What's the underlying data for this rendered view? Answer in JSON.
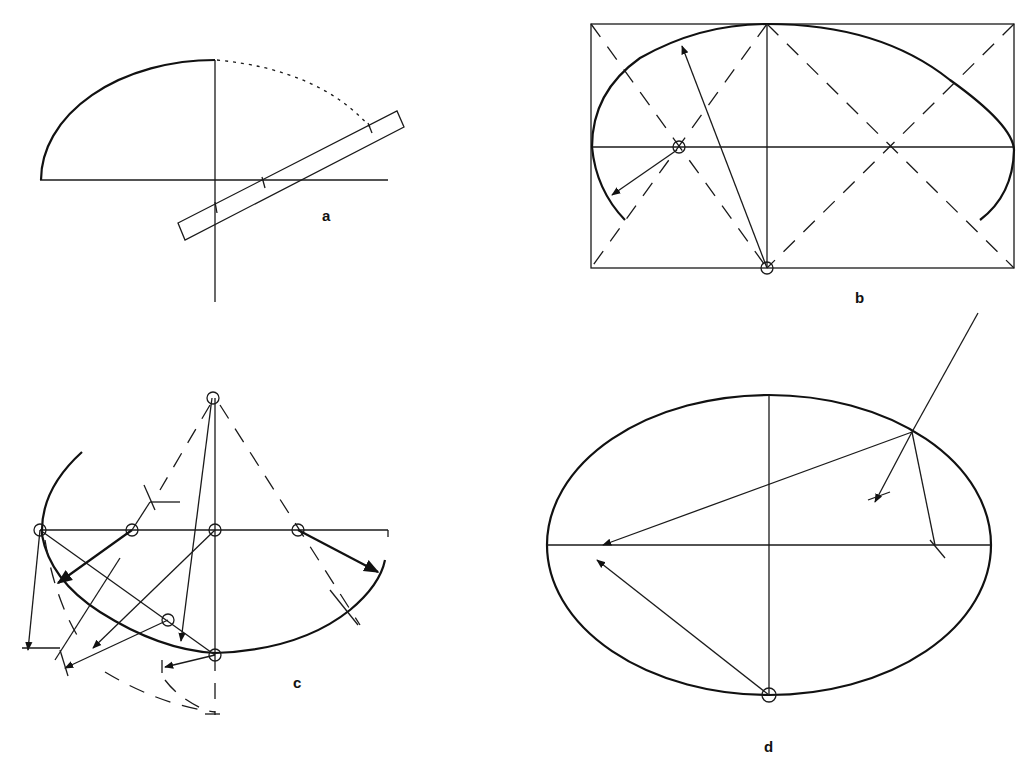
{
  "figures": {
    "a": {
      "label": "a",
      "description": "Trammel method: quarter ellipse with paper strip trammel marked at three points",
      "quarter_ellipse": {
        "cx": 215,
        "cy": 180,
        "rx": 174,
        "ry": 120
      },
      "axes": {
        "horizontal": [
          40,
          180,
          388,
          180
        ],
        "vertical": [
          215,
          60,
          215,
          302
        ]
      },
      "dotted_arc": {
        "from": [
          215,
          60
        ],
        "to": [
          370,
          127
        ]
      },
      "trammel_strip": [
        [
          178,
          223
        ],
        [
          397,
          111
        ],
        [
          404,
          127
        ],
        [
          185,
          240
        ]
      ],
      "trammel_marks": [
        [
          215,
          207
        ],
        [
          263,
          182
        ],
        [
          370,
          127
        ]
      ]
    },
    "b": {
      "label": "b",
      "description": "Four-center approximate ellipse within a rectangle",
      "rectangle": [
        591,
        24,
        1014,
        268
      ],
      "axes": {
        "horizontal": [
          591,
          147,
          1014,
          147
        ],
        "vertical": [
          767,
          24,
          767,
          268
        ]
      },
      "center_small": [
        679,
        147
      ],
      "center_large": [
        767,
        268
      ],
      "right_center": [
        857,
        147
      ]
    },
    "c": {
      "label": "c",
      "description": "Multi-center arc construction with compass swings",
      "major_axis": [
        40,
        530,
        388,
        530
      ],
      "minor_axis": [
        215,
        398,
        215,
        715
      ],
      "centers": [
        [
          40,
          530
        ],
        [
          132,
          530
        ],
        [
          215,
          530
        ],
        [
          298,
          530
        ],
        [
          168,
          620
        ],
        [
          215,
          655
        ],
        [
          212,
          398
        ]
      ]
    },
    "d": {
      "label": "d",
      "description": "Ellipse showing tangent/normal construction at a point",
      "ellipse": {
        "cx": 769,
        "cy": 545,
        "rx": 222,
        "ry": 150
      },
      "point_on_curve": [
        912,
        432
      ],
      "foci": [
        [
          603,
          545
        ],
        [
          935,
          545
        ]
      ],
      "center_bottom": [
        769,
        695
      ]
    }
  },
  "labels": {
    "a": "a",
    "b": "b",
    "c": "c",
    "d": "d"
  }
}
